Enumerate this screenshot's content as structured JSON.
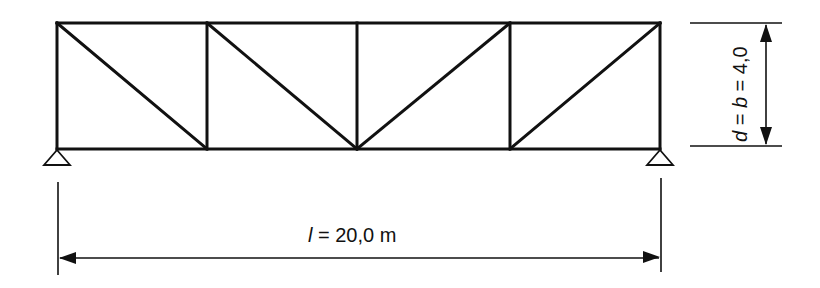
{
  "diagram": {
    "type": "truss",
    "panels": 4,
    "colors": {
      "line": "#111111",
      "background": "#ffffff"
    },
    "nodes": {
      "top": [
        [
          57,
          23
        ],
        [
          207,
          23
        ],
        [
          357,
          23
        ],
        [
          510,
          23
        ],
        [
          660,
          23
        ]
      ],
      "bottom": [
        [
          57,
          149
        ],
        [
          207,
          149
        ],
        [
          357,
          149
        ],
        [
          510,
          149
        ],
        [
          660,
          149
        ]
      ]
    },
    "diagonals": [
      [
        [
          57,
          23
        ],
        [
          207,
          149
        ]
      ],
      [
        [
          207,
          23
        ],
        [
          357,
          149
        ]
      ],
      [
        [
          357,
          149
        ],
        [
          510,
          23
        ]
      ],
      [
        [
          510,
          149
        ],
        [
          660,
          23
        ]
      ]
    ],
    "supports": [
      {
        "name": "left-support",
        "x": 57,
        "y": 149
      },
      {
        "name": "right-support",
        "x": 660,
        "y": 149
      }
    ]
  },
  "dimensions": {
    "span": {
      "symbol": "l",
      "text": " = 20,0 m",
      "value": 20.0,
      "unit": "m"
    },
    "height": {
      "symbol_d": "d",
      "symbol_b": "b",
      "text_mid": " = ",
      "text_end": " = 4,0",
      "value": 4.0
    }
  }
}
